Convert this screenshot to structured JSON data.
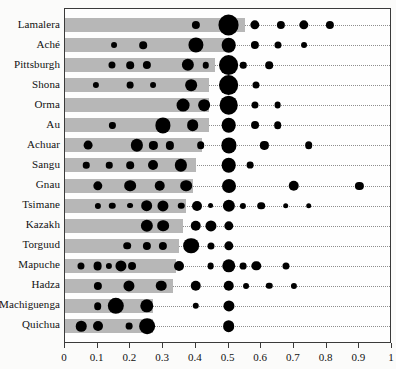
{
  "chart_data": {
    "type": "bar",
    "title": "",
    "subtitle": "",
    "xlabel": "",
    "ylabel": "",
    "xlim": [
      0,
      1
    ],
    "ylim": null,
    "grid": false,
    "legend": null,
    "axis": {
      "tick_values": [
        0,
        0.1,
        0.2,
        0.3,
        0.4,
        0.5,
        0.6,
        0.7,
        0.8,
        0.9,
        1
      ],
      "tick_labels": [
        "0",
        "0.1",
        "0.2",
        "0.3",
        "0.4",
        "0.5",
        "0.6",
        "0.7",
        "0.8",
        "0.9",
        "1"
      ]
    },
    "categories": [
      "Lamalera",
      "Aché",
      "Pittsburgh",
      "Shona",
      "Orma",
      "Au",
      "Achuar",
      "Sangu",
      "Gnau",
      "Tsimane",
      "Kazakh",
      "Torguud",
      "Mapuche",
      "Hadza",
      "Machiguenga",
      "Quichua"
    ],
    "bar_values": [
      0.55,
      0.5,
      0.46,
      0.44,
      0.44,
      0.44,
      0.42,
      0.4,
      0.39,
      0.37,
      0.36,
      0.35,
      0.34,
      0.33,
      0.27,
      0.27
    ],
    "series": [
      {
        "name": "Lamalera",
        "bar": 0.55,
        "points": [
          {
            "x": 0.4,
            "size": 0.18
          },
          {
            "x": 0.5,
            "size": 0.62
          },
          {
            "x": 0.58,
            "size": 0.22
          },
          {
            "x": 0.66,
            "size": 0.18
          },
          {
            "x": 0.73,
            "size": 0.22
          },
          {
            "x": 0.81,
            "size": 0.18
          }
        ]
      },
      {
        "name": "Aché",
        "bar": 0.5,
        "points": [
          {
            "x": 0.15,
            "size": 0.1
          },
          {
            "x": 0.24,
            "size": 0.16
          },
          {
            "x": 0.4,
            "size": 0.42
          },
          {
            "x": 0.5,
            "size": 0.4
          },
          {
            "x": 0.58,
            "size": 0.18
          },
          {
            "x": 0.65,
            "size": 0.14
          },
          {
            "x": 0.73,
            "size": 0.1
          }
        ]
      },
      {
        "name": "Pittsburgh",
        "bar": 0.46,
        "points": [
          {
            "x": 0.145,
            "size": 0.14
          },
          {
            "x": 0.2,
            "size": 0.16
          },
          {
            "x": 0.25,
            "size": 0.18
          },
          {
            "x": 0.375,
            "size": 0.32
          },
          {
            "x": 0.43,
            "size": 0.12
          },
          {
            "x": 0.5,
            "size": 0.58
          },
          {
            "x": 0.545,
            "size": 0.12
          },
          {
            "x": 0.625,
            "size": 0.16
          }
        ]
      },
      {
        "name": "Shona",
        "bar": 0.44,
        "points": [
          {
            "x": 0.095,
            "size": 0.11
          },
          {
            "x": 0.2,
            "size": 0.13
          },
          {
            "x": 0.27,
            "size": 0.1
          },
          {
            "x": 0.385,
            "size": 0.3
          },
          {
            "x": 0.5,
            "size": 0.58
          },
          {
            "x": 0.585,
            "size": 0.14
          }
        ]
      },
      {
        "name": "Orma",
        "bar": 0.44,
        "points": [
          {
            "x": 0.36,
            "size": 0.34
          },
          {
            "x": 0.425,
            "size": 0.3
          },
          {
            "x": 0.5,
            "size": 0.54
          },
          {
            "x": 0.58,
            "size": 0.14
          },
          {
            "x": 0.65,
            "size": 0.13
          }
        ]
      },
      {
        "name": "Au",
        "bar": 0.44,
        "points": [
          {
            "x": 0.145,
            "size": 0.11
          },
          {
            "x": 0.3,
            "size": 0.42
          },
          {
            "x": 0.39,
            "size": 0.3
          },
          {
            "x": 0.5,
            "size": 0.4
          },
          {
            "x": 0.58,
            "size": 0.17
          },
          {
            "x": 0.65,
            "size": 0.16
          }
        ]
      },
      {
        "name": "Achuar",
        "bar": 0.42,
        "points": [
          {
            "x": 0.07,
            "size": 0.2
          },
          {
            "x": 0.22,
            "size": 0.32
          },
          {
            "x": 0.27,
            "size": 0.18
          },
          {
            "x": 0.32,
            "size": 0.18
          },
          {
            "x": 0.415,
            "size": 0.16
          },
          {
            "x": 0.5,
            "size": 0.42
          },
          {
            "x": 0.61,
            "size": 0.18
          },
          {
            "x": 0.745,
            "size": 0.16
          }
        ]
      },
      {
        "name": "Sangu",
        "bar": 0.4,
        "points": [
          {
            "x": 0.065,
            "size": 0.12
          },
          {
            "x": 0.135,
            "size": 0.12
          },
          {
            "x": 0.2,
            "size": 0.16
          },
          {
            "x": 0.27,
            "size": 0.24
          },
          {
            "x": 0.355,
            "size": 0.32
          },
          {
            "x": 0.5,
            "size": 0.4
          },
          {
            "x": 0.565,
            "size": 0.13
          }
        ]
      },
      {
        "name": "Gnau",
        "bar": 0.39,
        "points": [
          {
            "x": 0.1,
            "size": 0.22
          },
          {
            "x": 0.2,
            "size": 0.3
          },
          {
            "x": 0.29,
            "size": 0.26
          },
          {
            "x": 0.37,
            "size": 0.3
          },
          {
            "x": 0.5,
            "size": 0.38
          },
          {
            "x": 0.7,
            "size": 0.26
          },
          {
            "x": 0.9,
            "size": 0.18
          }
        ]
      },
      {
        "name": "Tsimane",
        "bar": 0.37,
        "points": [
          {
            "x": 0.1,
            "size": 0.11
          },
          {
            "x": 0.145,
            "size": 0.12
          },
          {
            "x": 0.2,
            "size": 0.1
          },
          {
            "x": 0.25,
            "size": 0.3
          },
          {
            "x": 0.3,
            "size": 0.28
          },
          {
            "x": 0.355,
            "size": 0.12
          },
          {
            "x": 0.405,
            "size": 0.24
          },
          {
            "x": 0.445,
            "size": 0.1
          },
          {
            "x": 0.5,
            "size": 0.32
          },
          {
            "x": 0.545,
            "size": 0.11
          },
          {
            "x": 0.6,
            "size": 0.16
          },
          {
            "x": 0.675,
            "size": 0.09
          },
          {
            "x": 0.745,
            "size": 0.09
          }
        ]
      },
      {
        "name": "Kazakh",
        "bar": 0.36,
        "points": [
          {
            "x": 0.25,
            "size": 0.32
          },
          {
            "x": 0.3,
            "size": 0.3
          },
          {
            "x": 0.4,
            "size": 0.26
          },
          {
            "x": 0.445,
            "size": 0.28
          },
          {
            "x": 0.5,
            "size": 0.22
          }
        ]
      },
      {
        "name": "Torguud",
        "bar": 0.35,
        "points": [
          {
            "x": 0.19,
            "size": 0.16
          },
          {
            "x": 0.25,
            "size": 0.18
          },
          {
            "x": 0.3,
            "size": 0.18
          },
          {
            "x": 0.385,
            "size": 0.44
          },
          {
            "x": 0.445,
            "size": 0.14
          },
          {
            "x": 0.5,
            "size": 0.22
          }
        ]
      },
      {
        "name": "Mapuche",
        "bar": 0.34,
        "points": [
          {
            "x": 0.05,
            "size": 0.14
          },
          {
            "x": 0.1,
            "size": 0.2
          },
          {
            "x": 0.135,
            "size": 0.11
          },
          {
            "x": 0.17,
            "size": 0.28
          },
          {
            "x": 0.205,
            "size": 0.17
          },
          {
            "x": 0.35,
            "size": 0.24
          },
          {
            "x": 0.445,
            "size": 0.13
          },
          {
            "x": 0.5,
            "size": 0.36
          },
          {
            "x": 0.545,
            "size": 0.13
          },
          {
            "x": 0.585,
            "size": 0.22
          },
          {
            "x": 0.675,
            "size": 0.14
          }
        ]
      },
      {
        "name": "Hadza",
        "bar": 0.33,
        "points": [
          {
            "x": 0.1,
            "size": 0.18
          },
          {
            "x": 0.195,
            "size": 0.28
          },
          {
            "x": 0.295,
            "size": 0.26
          },
          {
            "x": 0.4,
            "size": 0.26
          },
          {
            "x": 0.5,
            "size": 0.26
          },
          {
            "x": 0.555,
            "size": 0.1
          },
          {
            "x": 0.625,
            "size": 0.12
          },
          {
            "x": 0.7,
            "size": 0.11
          }
        ]
      },
      {
        "name": "Machiguenga",
        "bar": 0.27,
        "points": [
          {
            "x": 0.1,
            "size": 0.16
          },
          {
            "x": 0.155,
            "size": 0.46
          },
          {
            "x": 0.25,
            "size": 0.36
          },
          {
            "x": 0.4,
            "size": 0.12
          },
          {
            "x": 0.5,
            "size": 0.28
          }
        ]
      },
      {
        "name": "Quichua",
        "bar": 0.27,
        "points": [
          {
            "x": 0.05,
            "size": 0.26
          },
          {
            "x": 0.1,
            "size": 0.24
          },
          {
            "x": 0.195,
            "size": 0.13
          },
          {
            "x": 0.25,
            "size": 0.44
          },
          {
            "x": 0.5,
            "size": 0.3
          }
        ]
      }
    ],
    "colors": {
      "bar": "#b7b7b7",
      "bubble": "#000000",
      "axis": "#3a3a3a",
      "guide": "#8e8e8e",
      "background": "#fefefe"
    }
  }
}
